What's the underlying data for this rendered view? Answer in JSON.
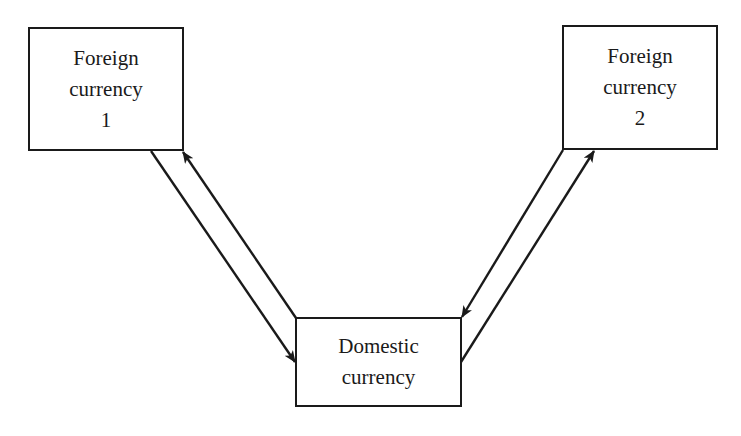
{
  "diagram": {
    "type": "flow",
    "nodes": [
      {
        "id": "foreign-1",
        "lines": [
          "Foreign",
          "currency",
          "1"
        ]
      },
      {
        "id": "foreign-2",
        "lines": [
          "Foreign",
          "currency",
          "2"
        ]
      },
      {
        "id": "domestic",
        "lines": [
          "Domestic",
          "currency"
        ]
      }
    ],
    "edges": [
      {
        "from": "foreign-1",
        "to": "domestic",
        "arrow": "to"
      },
      {
        "from": "domestic",
        "to": "foreign-1",
        "arrow": "to"
      },
      {
        "from": "foreign-2",
        "to": "domestic",
        "arrow": "to"
      },
      {
        "from": "domestic",
        "to": "foreign-2",
        "arrow": "to"
      }
    ],
    "colors": {
      "stroke": "#1a1a1a",
      "background": "#ffffff"
    }
  }
}
